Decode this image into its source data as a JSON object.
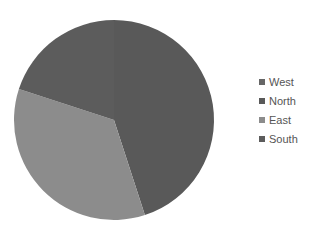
{
  "chart_data": {
    "type": "pie",
    "title": "",
    "categories": [
      "West",
      "North",
      "East",
      "South"
    ],
    "values": [
      0,
      45,
      35,
      20
    ],
    "unit": "percent (estimated)",
    "colors": [
      "#666666",
      "#595959",
      "#8c8c8c",
      "#5c5c5c"
    ],
    "start_angle_deg": 0,
    "direction": "clockwise",
    "legend": {
      "position": "right",
      "entries": [
        "West",
        "North",
        "East",
        "South"
      ]
    }
  },
  "legend": {
    "items": [
      {
        "label": "West",
        "color": "#666666"
      },
      {
        "label": "North",
        "color": "#595959"
      },
      {
        "label": "East",
        "color": "#8c8c8c"
      },
      {
        "label": "South",
        "color": "#5c5c5c"
      }
    ]
  }
}
